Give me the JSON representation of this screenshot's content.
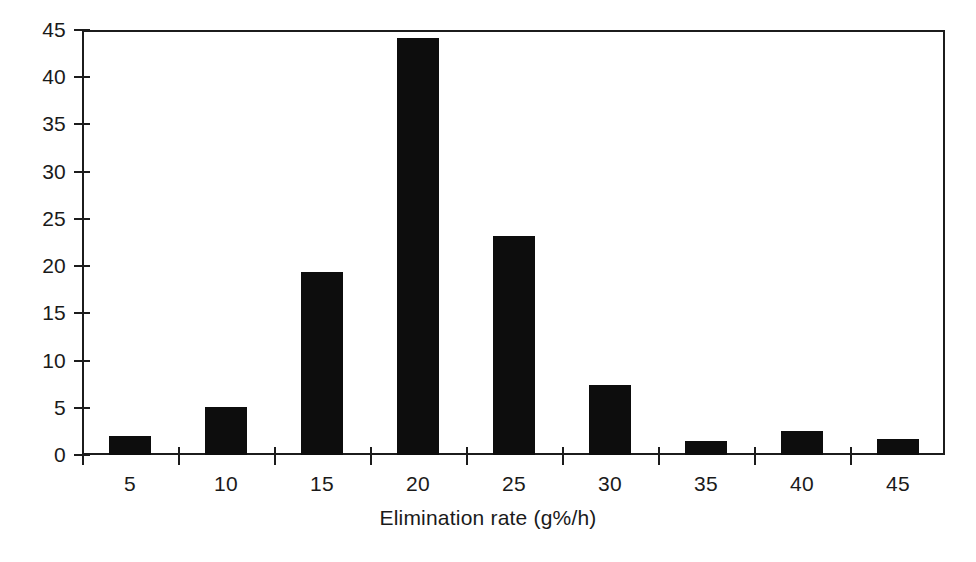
{
  "chart_data": {
    "type": "bar",
    "title": "",
    "subtitle": "",
    "xlabel": "Elimination rate (g%/h)",
    "ylabel": "",
    "categories": [
      "5",
      "10",
      "15",
      "20",
      "25",
      "30",
      "35",
      "40",
      "45"
    ],
    "values": [
      2.0,
      5.1,
      19.4,
      44.2,
      23.2,
      7.4,
      1.5,
      2.5,
      1.7
    ],
    "series": [
      {
        "name": "Frequency",
        "values": [
          2.0,
          5.1,
          19.4,
          44.2,
          23.2,
          7.4,
          1.5,
          2.5,
          1.7
        ]
      }
    ],
    "xlim": [
      0,
      9
    ],
    "ylim": [
      0,
      45
    ],
    "y_ticks": [
      "0",
      "5",
      "10",
      "15",
      "20",
      "25",
      "30",
      "35",
      "40",
      "45"
    ],
    "y_tick_values": [
      0,
      5,
      10,
      15,
      20,
      25,
      30,
      35,
      40,
      45
    ],
    "x_ticks": [
      "5",
      "10",
      "15",
      "20",
      "25",
      "30",
      "35",
      "40",
      "45"
    ],
    "grid": false,
    "legend": false,
    "legend_position": "none",
    "bar_color": "#0d0d0d",
    "axis_color": "#1c1c1c",
    "background_color": "#ffffff"
  }
}
